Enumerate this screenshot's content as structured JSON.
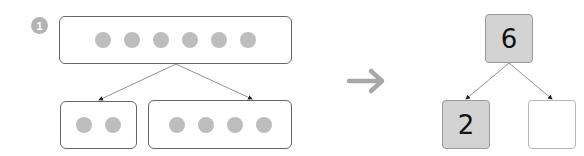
{
  "problem": {
    "number_badge": "1"
  },
  "dot_model": {
    "whole": {
      "count": 6
    },
    "parts": [
      {
        "count": 2
      },
      {
        "count": 4
      }
    ]
  },
  "transform_arrow": {
    "icon": "right-arrow-icon"
  },
  "number_bond": {
    "whole": "6",
    "part_left": "2",
    "part_right": ""
  },
  "colors": {
    "dot": "#bdbdbd",
    "filled_box": "#d3d3d3",
    "badge": "#b3b3b3",
    "arrow": "#aaaaaa"
  }
}
